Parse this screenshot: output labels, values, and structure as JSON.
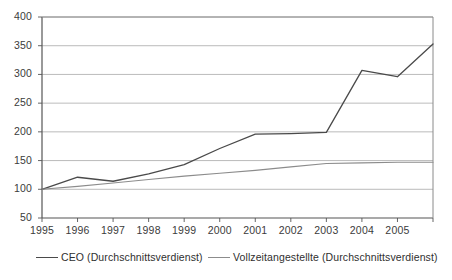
{
  "chart_data": {
    "type": "line",
    "title": "",
    "subtitle": "",
    "xlabel": "",
    "ylabel": "",
    "x": [
      1995,
      1996,
      1997,
      1998,
      1999,
      2000,
      2001,
      2002,
      2003,
      2004,
      2005,
      2006
    ],
    "categories": [
      "1995",
      "1996",
      "1997",
      "1998",
      "1999",
      "2000",
      "2001",
      "2002",
      "2003",
      "2004",
      "2005",
      ""
    ],
    "xtick_labels": [
      "1995",
      "1996",
      "1997",
      "1998",
      "1999",
      "2000",
      "2001",
      "2002",
      "2003",
      "2004",
      "2005"
    ],
    "ytick_labels": [
      "400",
      "350",
      "300",
      "250",
      "200",
      "150",
      "100",
      "50"
    ],
    "yticks": [
      400,
      350,
      300,
      250,
      200,
      150,
      100,
      50
    ],
    "ylim": [
      50,
      400
    ],
    "xlim": [
      1995,
      2006
    ],
    "grid": true,
    "grid_axis": "y",
    "legend_position": "bottom",
    "series": [
      {
        "name": "CEO (Durchschnittsverdienst)",
        "color": "#4a4a4a",
        "values": [
          100,
          121,
          114,
          127,
          143,
          171,
          196,
          197,
          199,
          307,
          296,
          353
        ]
      },
      {
        "name": "Vollzeitangestellte (Durchschnittsverdienst)",
        "color": "#8c8c8c",
        "values": [
          100,
          105,
          111,
          117,
          123,
          128,
          133,
          139,
          145,
          146,
          147,
          147
        ]
      }
    ]
  },
  "legend": {
    "entries": [
      {
        "label": "CEO (Durchschnittsverdienst)"
      },
      {
        "label": "Vollzeitangestellte (Durchschnittsverdienst)"
      }
    ]
  },
  "colors": {
    "series_ceo": "#4a4a4a",
    "series_employees": "#8c8c8c",
    "grid": "#a9a9a9",
    "axis": "#555555",
    "text": "#3b3b3b",
    "background": "#ffffff"
  }
}
